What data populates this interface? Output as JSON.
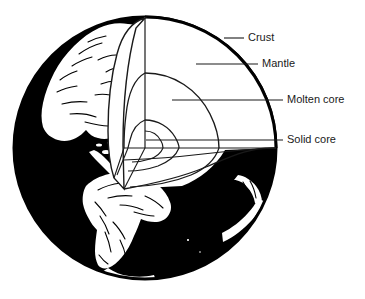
{
  "diagram": {
    "style": "black-and-white line art",
    "colors": {
      "ocean": "#000000",
      "land": "#ffffff",
      "outline": "#000000",
      "leader_line": "#1a1a1a",
      "label_text": "#1a1a1a",
      "background": "#ffffff"
    },
    "sphere": {
      "center_x": 145,
      "center_y": 148,
      "radius": 132
    },
    "labels": [
      {
        "id": "crust",
        "text": "Crust",
        "text_x": 248,
        "text_y": 38,
        "leader_x1": 224,
        "leader_y1": 38,
        "leader_x2": 244,
        "leader_y2": 38
      },
      {
        "id": "mantle",
        "text": "Mantle",
        "text_x": 262,
        "text_y": 64,
        "leader_x1": 196,
        "leader_y1": 64,
        "leader_x2": 258,
        "leader_y2": 64
      },
      {
        "id": "molten-core",
        "text": "Molten core",
        "text_x": 287,
        "text_y": 100,
        "leader_x1": 172,
        "leader_y1": 100,
        "leader_x2": 283,
        "leader_y2": 100
      },
      {
        "id": "solid-core",
        "text": "Solid core",
        "text_x": 287,
        "text_y": 140,
        "leader_x1": 146,
        "leader_y1": 140,
        "leader_x2": 283,
        "leader_y2": 140
      }
    ],
    "layers": [
      {
        "id": "crust",
        "name": "Crust",
        "order": 1,
        "position": "outermost shell"
      },
      {
        "id": "mantle",
        "name": "Mantle",
        "order": 2,
        "position": "below crust"
      },
      {
        "id": "molten-core",
        "name": "Molten core",
        "order": 3,
        "position": "outer core"
      },
      {
        "id": "solid-core",
        "name": "Solid core",
        "order": 4,
        "position": "innermost center"
      }
    ],
    "continents": [
      "North America",
      "Central America",
      "South America"
    ]
  }
}
